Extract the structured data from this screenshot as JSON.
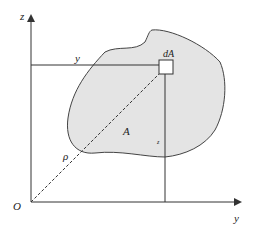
{
  "diagram": {
    "labels": {
      "z_axis": "z",
      "y_axis": "y",
      "origin": "O",
      "y_coord": "y",
      "z_coord": "z",
      "element": "dA",
      "area": "A",
      "radius": "ρ"
    },
    "colors": {
      "region_fill": "#e4e4e4",
      "stroke": "#333333",
      "background": "#ffffff"
    }
  }
}
